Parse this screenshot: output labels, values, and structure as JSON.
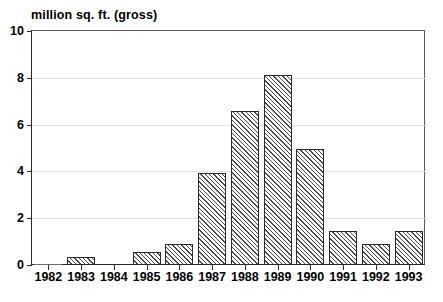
{
  "chart_data": {
    "type": "bar",
    "title": "million sq. ft. (gross)",
    "xlabel": "",
    "ylabel": "million sq. ft. (gross)",
    "categories": [
      "1982",
      "1983",
      "1984",
      "1985",
      "1986",
      "1987",
      "1988",
      "1989",
      "1990",
      "1991",
      "1992",
      "1993"
    ],
    "values": [
      0.03,
      0.35,
      0,
      0.55,
      0.9,
      3.95,
      6.6,
      8.1,
      4.95,
      1.45,
      0.9,
      1.45
    ],
    "ylim": [
      0,
      10
    ],
    "ytick_labels": [
      "0",
      "2",
      "4",
      "6",
      "8",
      "10"
    ],
    "ytick_values": [
      0,
      2,
      4,
      6,
      8,
      10
    ],
    "grid": true,
    "grid_axis": "y",
    "legend": null,
    "legend_position": "none",
    "bar_fill": "hatch-45-diagonal",
    "bar_edge_color": "#2b2b2b",
    "grid_color": "#e2e2e2",
    "axis_color": "#2b2b2b",
    "background_color": "#ffffff"
  }
}
